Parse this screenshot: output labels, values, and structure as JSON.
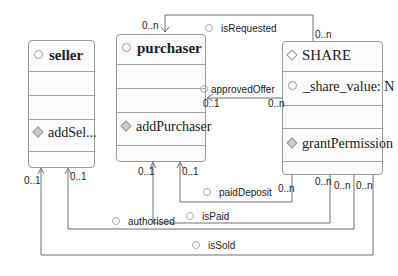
{
  "diagram": {
    "classes": [
      {
        "id": "seller",
        "name": "seller",
        "attributes": [],
        "operations": [
          "addSel..."
        ]
      },
      {
        "id": "purchaser",
        "name": "purchaser",
        "attributes": [],
        "operations": [
          "addPurchaser"
        ]
      },
      {
        "id": "share",
        "name": "SHARE",
        "attributes": [
          "_share_value: N"
        ],
        "operations": [
          "grantPermission"
        ]
      }
    ],
    "associations": [
      {
        "name": "isRequested",
        "from": "SHARE",
        "to": "purchaser",
        "from_mult": "0..n",
        "to_mult": "0..n"
      },
      {
        "name": "approvedOffer",
        "from": "SHARE",
        "to": "purchaser",
        "from_mult": "0..n",
        "to_mult": "0..1"
      },
      {
        "name": "paidDeposit",
        "from": "SHARE",
        "to": "purchaser",
        "from_mult": "0..n",
        "to_mult": "0..1"
      },
      {
        "name": "isPaid",
        "from": "SHARE",
        "to": "purchaser",
        "from_mult": "0..n",
        "to_mult": "0..1"
      },
      {
        "name": "authorised",
        "from": "SHARE",
        "to": "seller",
        "from_mult": "0..n",
        "to_mult": "0..1"
      },
      {
        "name": "isSold",
        "from": "SHARE",
        "to": "seller",
        "from_mult": "0..n",
        "to_mult": "0..1"
      }
    ],
    "colors": {
      "line": "#6f6f6f",
      "box_border": "#9a9a9a",
      "box_fill": "#fbfbfb"
    }
  }
}
